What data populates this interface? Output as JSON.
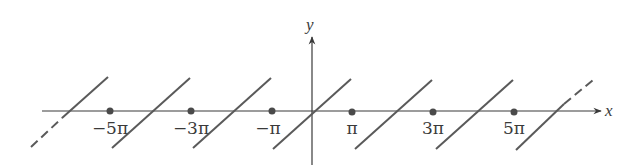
{
  "figure": {
    "type": "diagram",
    "x_axis_label": "x",
    "y_axis_label": "y",
    "tick_labels": [
      "−5π",
      "−3π",
      "−π",
      "π",
      "3π",
      "5π"
    ],
    "tick_values_in_pi": [
      -5,
      -3,
      -1,
      1,
      3,
      5
    ],
    "segment_centers_in_pi": [
      -6,
      -4,
      -2,
      0,
      2,
      4,
      6
    ],
    "dashed_extensions": [
      "left end lower half of segment at -6π",
      "right end upper half of segment at 6π"
    ],
    "colors": {
      "line": "#5a5a5a",
      "axis": "#3a3a3a",
      "background": "#ffffff"
    }
  }
}
